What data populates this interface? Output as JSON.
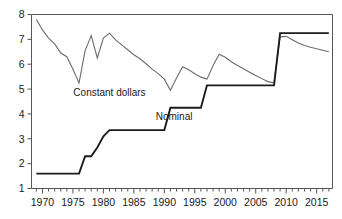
{
  "chart_data": {
    "type": "line",
    "title": "",
    "subtitle": "",
    "xlabel": "",
    "ylabel": "",
    "xlim": [
      1968.2,
      2017.6
    ],
    "ylim": [
      1,
      8
    ],
    "grid": false,
    "legend_position": "inline-annotation",
    "y_ticks": [
      1,
      2,
      3,
      4,
      5,
      6,
      7,
      8
    ],
    "y_tick_labels": [
      "1",
      "2",
      "3",
      "4",
      "5",
      "6",
      "7",
      "8"
    ],
    "x_ticks": [
      1970,
      1975,
      1980,
      1985,
      1990,
      1995,
      2000,
      2005,
      2010,
      2015
    ],
    "x_tick_labels": [
      "1970",
      "1975",
      "1980",
      "1985",
      "1990",
      "1995",
      "2000",
      "2005",
      "2010",
      "2015"
    ],
    "x_minor_tick_interval": 1,
    "annotations": [
      {
        "text": "Constant dollars",
        "x": 1981.0,
        "y": 4.72
      },
      {
        "text": "Nominal",
        "x": 1991.6,
        "y": 3.74
      }
    ],
    "series": [
      {
        "name": "Constant dollars",
        "color": "#6b6b6b",
        "style": "thin-line",
        "x": [
          1969,
          1970,
          1971,
          1972,
          1973,
          1974,
          1975,
          1976,
          1977,
          1978,
          1979,
          1980,
          1981,
          1982,
          1983,
          1984,
          1985,
          1986,
          1987,
          1988,
          1989,
          1990,
          1991,
          1992,
          1993,
          1994,
          1995,
          1996,
          1997,
          1998,
          1999,
          2000,
          2001,
          2002,
          2003,
          2004,
          2005,
          2006,
          2007,
          2008,
          2009,
          2010,
          2011,
          2012,
          2013,
          2014,
          2015,
          2016,
          2017
        ],
        "values": [
          7.8,
          7.38,
          7.05,
          6.82,
          6.45,
          6.3,
          5.8,
          5.25,
          6.55,
          7.15,
          6.25,
          7.05,
          7.25,
          6.98,
          6.78,
          6.58,
          6.38,
          6.22,
          6.02,
          5.8,
          5.62,
          5.4,
          4.95,
          5.45,
          5.9,
          5.78,
          5.62,
          5.48,
          5.4,
          5.95,
          6.4,
          6.28,
          6.1,
          5.95,
          5.82,
          5.68,
          5.55,
          5.42,
          5.3,
          5.25,
          7.1,
          7.12,
          6.98,
          6.85,
          6.75,
          6.68,
          6.62,
          6.56,
          6.5
        ]
      },
      {
        "name": "Nominal",
        "color": "#1c1c1c",
        "style": "thick-step",
        "x": [
          1969,
          1970,
          1971,
          1972,
          1973,
          1974,
          1975,
          1976,
          1977,
          1978,
          1979,
          1980,
          1981,
          1982,
          1983,
          1984,
          1985,
          1986,
          1987,
          1988,
          1989,
          1990,
          1991,
          1992,
          1993,
          1994,
          1995,
          1996,
          1997,
          1998,
          1999,
          2000,
          2001,
          2002,
          2003,
          2004,
          2005,
          2006,
          2007,
          2008,
          2009,
          2010,
          2011,
          2012,
          2013,
          2014,
          2015,
          2016,
          2017
        ],
        "values": [
          1.6,
          1.6,
          1.6,
          1.6,
          1.6,
          1.6,
          1.6,
          1.6,
          2.3,
          2.3,
          2.65,
          3.1,
          3.35,
          3.35,
          3.35,
          3.35,
          3.35,
          3.35,
          3.35,
          3.35,
          3.35,
          3.35,
          4.25,
          4.25,
          4.25,
          4.25,
          4.25,
          4.25,
          5.15,
          5.15,
          5.15,
          5.15,
          5.15,
          5.15,
          5.15,
          5.15,
          5.15,
          5.15,
          5.15,
          5.15,
          7.25,
          7.25,
          7.25,
          7.25,
          7.25,
          7.25,
          7.25,
          7.25,
          7.25
        ]
      }
    ]
  }
}
